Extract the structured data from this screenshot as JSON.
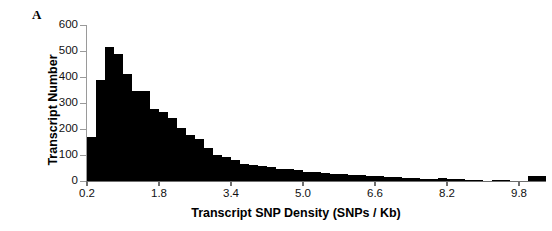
{
  "figure": {
    "panel_letter": "A",
    "background_color": "#ffffff",
    "bar_color": "#000000",
    "axis_color": "#6e6e6e"
  },
  "chart_data": {
    "type": "bar",
    "title": "",
    "subtitle": "",
    "xlabel": "Transcript SNP Density (SNPs / Kb)",
    "ylabel": "Transcript Number",
    "xlim": [
      0.2,
      10.4
    ],
    "ylim": [
      0,
      600
    ],
    "xticks": [
      0.2,
      1.8,
      3.4,
      5.0,
      6.6,
      8.2,
      9.8
    ],
    "xtick_labels": [
      "0.2",
      "1.8",
      "3.4",
      "5.0",
      "6.6",
      "8.2",
      "9.8"
    ],
    "yticks": [
      0,
      100,
      200,
      300,
      400,
      500,
      600
    ],
    "ytick_labels": [
      "0",
      "100",
      "200",
      "300",
      "400",
      "500",
      "600"
    ],
    "grid": false,
    "legend": null,
    "bin_width": 0.2,
    "categories": [
      "0.3",
      "0.5",
      "0.7",
      "0.9",
      "1.1",
      "1.3",
      "1.5",
      "1.7",
      "1.9",
      "2.1",
      "2.3",
      "2.5",
      "2.7",
      "2.9",
      "3.1",
      "3.3",
      "3.5",
      "3.7",
      "3.9",
      "4.1",
      "4.3",
      "4.5",
      "4.7",
      "4.9",
      "5.1",
      "5.3",
      "5.5",
      "5.7",
      "5.9",
      "6.1",
      "6.3",
      "6.5",
      "6.7",
      "6.9",
      "7.1",
      "7.3",
      "7.5",
      "7.7",
      "7.9",
      "8.1",
      "8.3",
      "8.5",
      "8.7",
      "8.9",
      "9.1",
      "9.3",
      "9.5",
      "9.7",
      "9.9",
      "10.1",
      "10.3"
    ],
    "values": [
      170,
      388,
      515,
      487,
      410,
      348,
      348,
      278,
      265,
      243,
      205,
      178,
      160,
      128,
      100,
      92,
      80,
      66,
      62,
      58,
      52,
      48,
      45,
      42,
      36,
      33,
      31,
      28,
      26,
      24,
      22,
      20,
      18,
      16,
      14,
      12,
      10,
      9,
      8,
      12,
      7,
      6,
      5,
      4,
      0,
      5,
      5,
      0,
      0,
      18,
      18
    ],
    "ylabel_note": "Transcript Number",
    "peak_value": 515,
    "peak_category": "0.7"
  }
}
